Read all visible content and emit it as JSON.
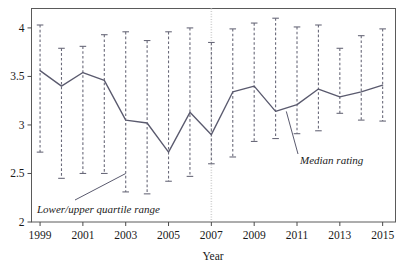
{
  "chart_data": {
    "type": "line",
    "title": "",
    "xlabel": "Year",
    "ylabel": "",
    "xlim": [
      1998.6,
      2015.6
    ],
    "ylim": [
      2.0,
      4.2
    ],
    "grid": false,
    "legend_position": "none",
    "x": [
      1999,
      2000,
      2001,
      2002,
      2003,
      2004,
      2005,
      2006,
      2007,
      2008,
      2009,
      2010,
      2011,
      2012,
      2013,
      2014,
      2015
    ],
    "xtick_labels": [
      "1999",
      "2001",
      "2003",
      "2005",
      "2007",
      "2009",
      "2011",
      "2013",
      "2015"
    ],
    "xticks": [
      1999,
      2001,
      2003,
      2005,
      2007,
      2009,
      2011,
      2013,
      2015
    ],
    "ytick_labels": [
      "2",
      "2.5",
      "3",
      "3.5",
      "4"
    ],
    "yticks": [
      2,
      2.5,
      3,
      3.5,
      4
    ],
    "series": [
      {
        "name": "Median rating",
        "values": [
          3.56,
          3.4,
          3.54,
          3.46,
          3.05,
          3.02,
          2.72,
          3.13,
          2.9,
          3.34,
          3.4,
          3.14,
          3.21,
          3.37,
          3.29,
          3.34,
          3.41
        ]
      }
    ],
    "error_bars": {
      "name": "Lower/upper quartile range",
      "upper": [
        4.03,
        3.79,
        3.81,
        3.93,
        3.96,
        3.87,
        3.96,
        4.0,
        3.85,
        3.99,
        4.05,
        4.1,
        4.01,
        4.03,
        3.79,
        3.92,
        3.99
      ],
      "lower": [
        2.72,
        2.45,
        2.5,
        2.5,
        2.31,
        2.29,
        2.42,
        2.47,
        2.6,
        2.67,
        2.83,
        2.86,
        2.91,
        2.94,
        3.12,
        3.05,
        3.04
      ]
    },
    "reference_line": {
      "orientation": "vertical",
      "value": 2007,
      "style": "dotted",
      "color": "#d0d0d0"
    },
    "annotations": [
      {
        "text": "Lower/upper quartile range",
        "target_x": 2003,
        "target_y": 2.5
      },
      {
        "text": "Median rating",
        "target_x": 2010.5,
        "target_y": 3.14
      }
    ],
    "colors": {
      "line": "#5a5a6e",
      "error_bar": "#6a6a7a",
      "axis": "#4a4a4a",
      "reference": "#d8d8d8",
      "text": "#1a1a1a"
    }
  }
}
